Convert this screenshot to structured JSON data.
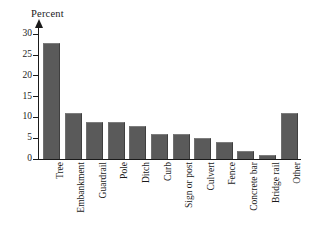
{
  "chart_data": {
    "type": "bar",
    "title": "",
    "subtitle": "",
    "xlabel": "",
    "ylabel": "Percent",
    "ylim": [
      0,
      32
    ],
    "grid": false,
    "legend": false,
    "orientation": "vertical",
    "bar_color": "#5a5a5a",
    "axis_color": "#1a1a1a",
    "background": "#ffffff",
    "y_ticks": [
      0,
      5,
      10,
      15,
      20,
      25,
      30
    ],
    "y_tick_labels": [
      "0",
      "5",
      "10",
      "15",
      "20",
      "25",
      "30"
    ],
    "categories": [
      "Tree",
      "Embankment",
      "Guardrail",
      "Pole",
      "Ditch",
      "Curb",
      "Sign or post",
      "Culvert",
      "Fence",
      "Concrete bar",
      "Bridge rail",
      "Other"
    ],
    "values": [
      28,
      11,
      9,
      9,
      8,
      6,
      6,
      5,
      4,
      2,
      1,
      11
    ],
    "annotations": []
  }
}
